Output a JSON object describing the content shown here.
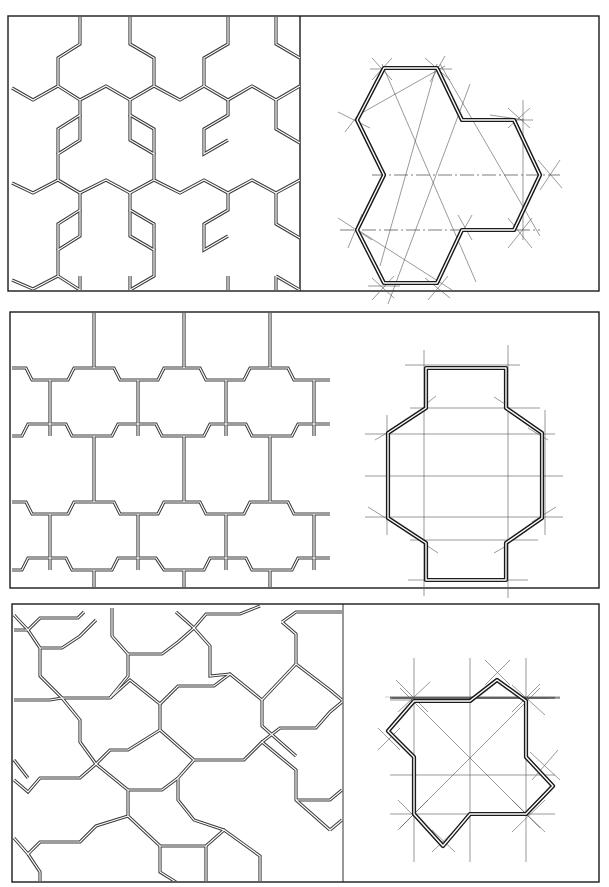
{
  "page": {
    "background": "#ffffff",
    "ink_color": "#1a1a1a"
  },
  "panels": [
    {
      "id": "panel-1",
      "tile_shape": "tri-lobed hexagonal tile (three joined hexagons)",
      "pattern": "tessellation of tri-lobed tiles",
      "construction": "three-hexagon tile on triangular grid with center axes"
    },
    {
      "id": "panel-2",
      "tile_shape": "elongated octagonal cross tile",
      "pattern": "staggered brick-like tessellation of notched tiles",
      "construction": "octagon with rectangular tabs on orthogonal grid"
    },
    {
      "id": "panel-3",
      "tile_shape": "pinwheel cross tile",
      "pattern": "rotated interlocking tessellation",
      "construction": "square grid with diagonals and star-point markers"
    }
  ]
}
